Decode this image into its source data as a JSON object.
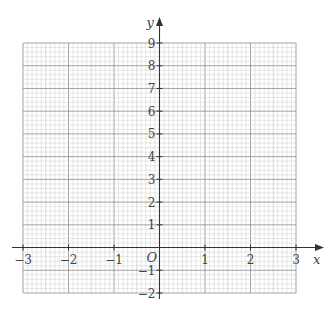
{
  "chart_data": {
    "type": "graph-paper",
    "title": "",
    "xlabel": "x",
    "ylabel": "y",
    "origin_label": "O",
    "xlim": [
      -3,
      3
    ],
    "ylim": [
      -2,
      9
    ],
    "x_ticks": [
      "-3",
      "-2",
      "-1",
      "1",
      "2",
      "3"
    ],
    "y_ticks": [
      "-2",
      "-1",
      "1",
      "2",
      "3",
      "4",
      "5",
      "6",
      "7",
      "8",
      "9"
    ],
    "grid": true,
    "minor_x_per_unit": 10,
    "minor_y_per_unit": 5,
    "series": []
  },
  "colors": {
    "minor_grid": "#cfcfcf",
    "major_grid": "#999999",
    "axis": "#333333"
  }
}
